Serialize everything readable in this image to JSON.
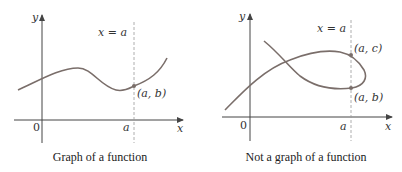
{
  "panels": [
    {
      "caption": "Graph of a function",
      "axis_x": "x",
      "axis_y": "y",
      "origin": "0",
      "a_tick": "a",
      "line_label": "x = a",
      "points": [
        {
          "label": "(a, b)"
        }
      ]
    },
    {
      "caption": "Not a graph of a function",
      "axis_x": "x",
      "axis_y": "y",
      "origin": "0",
      "a_tick": "a",
      "line_label": "x = a",
      "points": [
        {
          "label": "(a, c)"
        },
        {
          "label": "(a, b)"
        }
      ]
    }
  ],
  "colors": {
    "curve": "#7a6e6a",
    "axis": "#444444",
    "dashed": "#999999"
  }
}
